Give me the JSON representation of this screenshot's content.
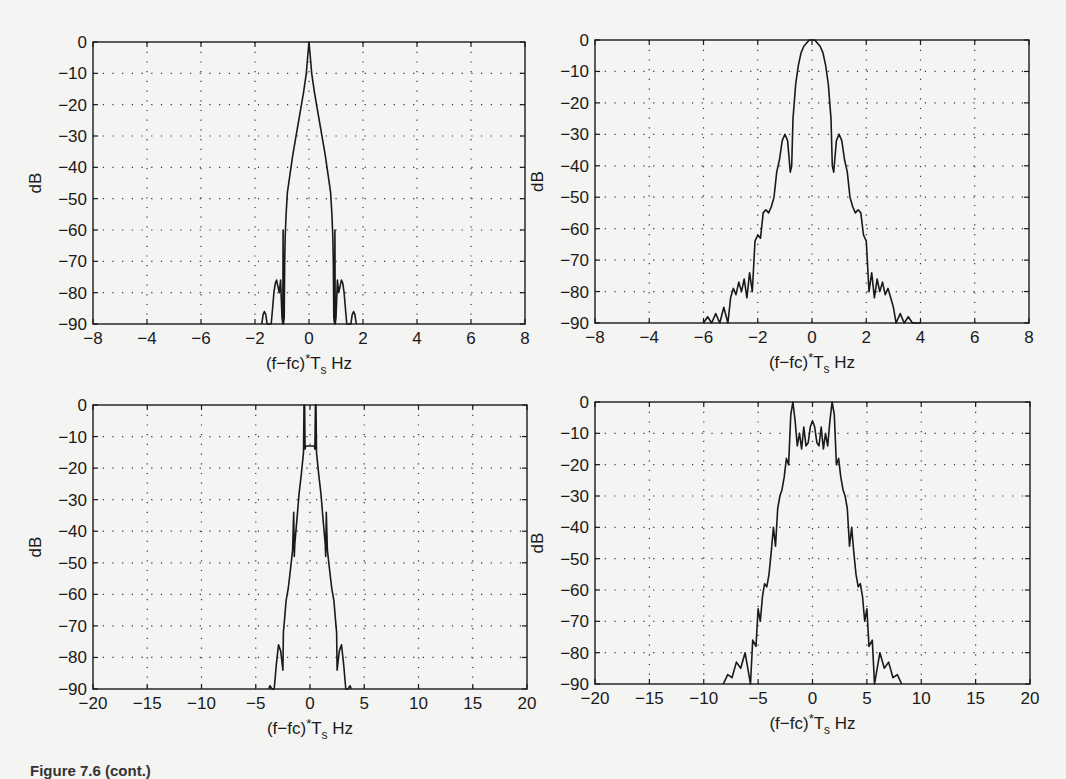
{
  "figure": {
    "caption": "Figure 7.6 (cont.)"
  },
  "colors": {
    "background": "#f4f4f2",
    "line": "#1a1a1a",
    "grid": "#333333"
  },
  "chart_data": [
    {
      "id": "top-left",
      "type": "line",
      "title": "",
      "xlabel": "(f-fc)*T_s Hz",
      "ylabel": "dB",
      "xlim": [
        -8,
        8
      ],
      "ylim": [
        -90,
        0
      ],
      "grid": true,
      "box": {
        "x0": 93,
        "x1": 525,
        "y0": 42,
        "y1": 324
      },
      "xticks": [
        -8,
        -6,
        -4,
        -2,
        0,
        2,
        4,
        6,
        8
      ],
      "xtick_labels": [
        "-8",
        "-4",
        "-6",
        "-2",
        "0",
        "2",
        "4",
        "6",
        "8"
      ],
      "yticks": [
        0,
        -10,
        -20,
        -30,
        -40,
        -50,
        -60,
        -70,
        -80,
        -90
      ],
      "ytick_labels": [
        "0",
        "-10",
        "-20",
        "-30",
        "-40",
        "-50",
        "-60",
        "-70",
        "-80",
        "-90"
      ],
      "series": [
        {
          "name": "spectrum",
          "x": [
            -1.75,
            -1.7,
            -1.65,
            -1.6,
            -1.55,
            -1.5,
            -1.45,
            -1.4,
            -1.35,
            -1.3,
            -1.25,
            -1.2,
            -1.15,
            -1.1,
            -1.05,
            -1.0,
            -0.97,
            -0.96,
            -0.95,
            -0.92,
            -0.9,
            -0.88,
            -0.85,
            -0.8,
            -0.7,
            -0.6,
            -0.5,
            -0.4,
            -0.3,
            -0.2,
            -0.1,
            -0.05,
            0,
            0.05,
            0.1,
            0.2,
            0.3,
            0.4,
            0.5,
            0.6,
            0.7,
            0.8,
            0.85,
            0.88,
            0.9,
            0.92,
            0.95,
            0.96,
            0.97,
            1.0,
            1.05,
            1.1,
            1.15,
            1.2,
            1.25,
            1.3,
            1.35,
            1.4,
            1.45,
            1.5,
            1.55,
            1.6,
            1.65,
            1.7,
            1.75
          ],
          "values": [
            -90,
            -87,
            -86,
            -87,
            -90,
            -90,
            -90,
            -90,
            -85,
            -80,
            -77,
            -76,
            -78,
            -80,
            -76,
            -88,
            -90,
            -60,
            -90,
            -88,
            -70,
            -62,
            -55,
            -48,
            -42,
            -36,
            -31,
            -26,
            -21,
            -16,
            -10,
            -5,
            0,
            -5,
            -10,
            -16,
            -21,
            -26,
            -31,
            -36,
            -42,
            -48,
            -55,
            -62,
            -70,
            -88,
            -90,
            -60,
            -90,
            -88,
            -76,
            -80,
            -78,
            -76,
            -77,
            -80,
            -85,
            -90,
            -90,
            -90,
            -90,
            -87,
            -86,
            -87,
            -90
          ]
        }
      ]
    },
    {
      "id": "top-right",
      "type": "line",
      "title": "",
      "xlabel": "(f-fc)*T_s Hz",
      "ylabel": "dB",
      "xlim": [
        -8,
        8
      ],
      "ylim": [
        -90,
        0
      ],
      "grid": true,
      "box": {
        "x0": 595,
        "x1": 1029,
        "y0": 40,
        "y1": 323
      },
      "xticks": [
        -8,
        -6,
        -4,
        -2,
        0,
        2,
        4,
        6,
        8
      ],
      "xtick_labels": [
        "-8",
        "-4",
        "-6",
        "-2",
        "0",
        "2",
        "4",
        "6",
        "8"
      ],
      "yticks": [
        0,
        -10,
        -20,
        -30,
        -40,
        -50,
        -60,
        -70,
        -80,
        -90
      ],
      "ytick_labels": [
        "0",
        "-10",
        "-20",
        "-30",
        "-40",
        "-50",
        "-60",
        "-70",
        "-80",
        "-90"
      ],
      "series": [
        {
          "name": "spectrum",
          "x": [
            -4.0,
            -3.85,
            -3.7,
            -3.55,
            -3.4,
            -3.25,
            -3.1,
            -3.0,
            -2.9,
            -2.8,
            -2.7,
            -2.6,
            -2.5,
            -2.4,
            -2.3,
            -2.2,
            -2.1,
            -2.0,
            -1.9,
            -1.8,
            -1.7,
            -1.6,
            -1.5,
            -1.4,
            -1.3,
            -1.2,
            -1.1,
            -1.0,
            -0.9,
            -0.8,
            -0.75,
            -0.7,
            -0.6,
            -0.5,
            -0.4,
            -0.3,
            -0.2,
            -0.1,
            0,
            0.1,
            0.2,
            0.3,
            0.4,
            0.5,
            0.6,
            0.7,
            0.75,
            0.8,
            0.9,
            1.0,
            1.1,
            1.2,
            1.3,
            1.4,
            1.5,
            1.6,
            1.7,
            1.8,
            1.9,
            2.0,
            2.1,
            2.2,
            2.3,
            2.4,
            2.5,
            2.6,
            2.7,
            2.8,
            2.9,
            3.0,
            3.1,
            3.25,
            3.4,
            3.55,
            3.7,
            3.85,
            4.0
          ],
          "values": [
            -90,
            -88,
            -90,
            -87,
            -90,
            -85,
            -90,
            -82,
            -79,
            -81,
            -77,
            -80,
            -76,
            -82,
            -74,
            -80,
            -64,
            -62,
            -63,
            -55,
            -54,
            -55,
            -53,
            -50,
            -42,
            -38,
            -32,
            -30,
            -32,
            -42,
            -40,
            -25,
            -14,
            -8,
            -4,
            -2,
            -1,
            0,
            0,
            0,
            -1,
            -2,
            -4,
            -8,
            -14,
            -25,
            -40,
            -42,
            -32,
            -30,
            -32,
            -38,
            -42,
            -50,
            -53,
            -55,
            -54,
            -55,
            -62,
            -64,
            -80,
            -74,
            -82,
            -76,
            -80,
            -77,
            -81,
            -79,
            -82,
            -85,
            -90,
            -87,
            -90,
            -88,
            -90,
            -90,
            -90
          ]
        }
      ]
    },
    {
      "id": "bottom-left",
      "type": "line",
      "title": "",
      "xlabel": "(f-fc)*T_s Hz",
      "ylabel": "dB",
      "xlim": [
        -20,
        20
      ],
      "ylim": [
        -90,
        0
      ],
      "grid": true,
      "box": {
        "x0": 93,
        "x1": 527,
        "y0": 405,
        "y1": 689
      },
      "xticks": [
        -20,
        -15,
        -10,
        -5,
        0,
        5,
        10,
        15,
        20
      ],
      "xtick_labels": [
        "-20",
        "-15",
        "-10",
        "-5",
        "0",
        "5",
        "10",
        "15",
        "20"
      ],
      "yticks": [
        0,
        -10,
        -20,
        -30,
        -40,
        -50,
        -60,
        -70,
        -80,
        -90
      ],
      "ytick_labels": [
        "0",
        "-10",
        "-20",
        "-30",
        "-40",
        "-50",
        "-60",
        "-70",
        "-80",
        "-90"
      ],
      "series": [
        {
          "name": "spectrum",
          "x": [
            -3.8,
            -3.7,
            -3.5,
            -3.3,
            -3.1,
            -2.9,
            -2.7,
            -2.5,
            -2.45,
            -2.4,
            -2.2,
            -2.0,
            -1.8,
            -1.6,
            -1.5,
            -1.45,
            -1.4,
            -1.2,
            -1.0,
            -0.8,
            -0.6,
            -0.55,
            -0.5,
            -0.45,
            -0.4,
            -0.2,
            0,
            0.2,
            0.4,
            0.45,
            0.5,
            0.55,
            0.6,
            0.8,
            1.0,
            1.2,
            1.4,
            1.45,
            1.5,
            1.6,
            1.8,
            2.0,
            2.2,
            2.4,
            2.45,
            2.5,
            2.7,
            2.9,
            3.1,
            3.3,
            3.5,
            3.7,
            3.8
          ],
          "values": [
            -90,
            -89,
            -90,
            -90,
            -82,
            -76,
            -78,
            -84,
            -72,
            -70,
            -62,
            -58,
            -52,
            -46,
            -34,
            -48,
            -44,
            -36,
            -28,
            -22,
            -15,
            0,
            0,
            -14,
            -13,
            -13,
            -13,
            -13,
            -13,
            -14,
            0,
            0,
            -15,
            -22,
            -28,
            -36,
            -44,
            -48,
            -34,
            -46,
            -52,
            -58,
            -62,
            -70,
            -72,
            -84,
            -78,
            -76,
            -82,
            -90,
            -90,
            -89,
            -90
          ]
        }
      ]
    },
    {
      "id": "bottom-right",
      "type": "line",
      "title": "",
      "xlabel": "(f-fc)*T_s Hz",
      "ylabel": "dB",
      "xlim": [
        -20,
        20
      ],
      "ylim": [
        -90,
        0
      ],
      "grid": true,
      "box": {
        "x0": 595,
        "x1": 1030,
        "y0": 402,
        "y1": 684
      },
      "xticks": [
        -20,
        -15,
        -10,
        -5,
        0,
        5,
        10,
        15,
        20
      ],
      "xtick_labels": [
        "-20",
        "-15",
        "-10",
        "-5",
        "0",
        "5",
        "10",
        "15",
        "20"
      ],
      "yticks": [
        0,
        -10,
        -20,
        -30,
        -40,
        -50,
        -60,
        -70,
        -80,
        -90
      ],
      "ytick_labels": [
        "0",
        "-10",
        "-20",
        "-30",
        "-40",
        "-50",
        "-60",
        "-70",
        "-80",
        "-90"
      ],
      "series": [
        {
          "name": "spectrum",
          "x": [
            -8.2,
            -7.8,
            -7.4,
            -7.0,
            -6.6,
            -6.2,
            -5.8,
            -5.7,
            -5.5,
            -5.2,
            -5.0,
            -4.8,
            -4.6,
            -4.4,
            -4.2,
            -4.0,
            -3.8,
            -3.6,
            -3.4,
            -3.2,
            -3.0,
            -2.8,
            -2.6,
            -2.4,
            -2.2,
            -2.0,
            -1.8,
            -1.6,
            -1.4,
            -1.2,
            -1.0,
            -0.8,
            -0.6,
            -0.4,
            -0.2,
            0,
            0.2,
            0.4,
            0.6,
            0.8,
            1.0,
            1.2,
            1.4,
            1.6,
            1.8,
            2.0,
            2.2,
            2.4,
            2.6,
            2.8,
            3.0,
            3.2,
            3.4,
            3.6,
            3.8,
            4.0,
            4.2,
            4.4,
            4.6,
            4.8,
            5.0,
            5.2,
            5.5,
            5.7,
            5.8,
            6.2,
            6.6,
            7.0,
            7.4,
            7.8,
            8.2
          ],
          "values": [
            -90,
            -87,
            -88,
            -83,
            -85,
            -80,
            -88,
            -90,
            -76,
            -78,
            -66,
            -70,
            -62,
            -58,
            -59,
            -55,
            -48,
            -40,
            -46,
            -34,
            -30,
            -28,
            -24,
            -18,
            -20,
            -4,
            0,
            -6,
            -14,
            -10,
            -15,
            -8,
            -14,
            -13,
            -8,
            -6,
            -8,
            -13,
            -14,
            -8,
            -15,
            -10,
            -14,
            -6,
            0,
            -4,
            -20,
            -18,
            -24,
            -28,
            -30,
            -34,
            -46,
            -40,
            -48,
            -55,
            -59,
            -58,
            -62,
            -70,
            -66,
            -78,
            -76,
            -90,
            -88,
            -80,
            -85,
            -83,
            -88,
            -87,
            -90
          ]
        }
      ]
    }
  ]
}
